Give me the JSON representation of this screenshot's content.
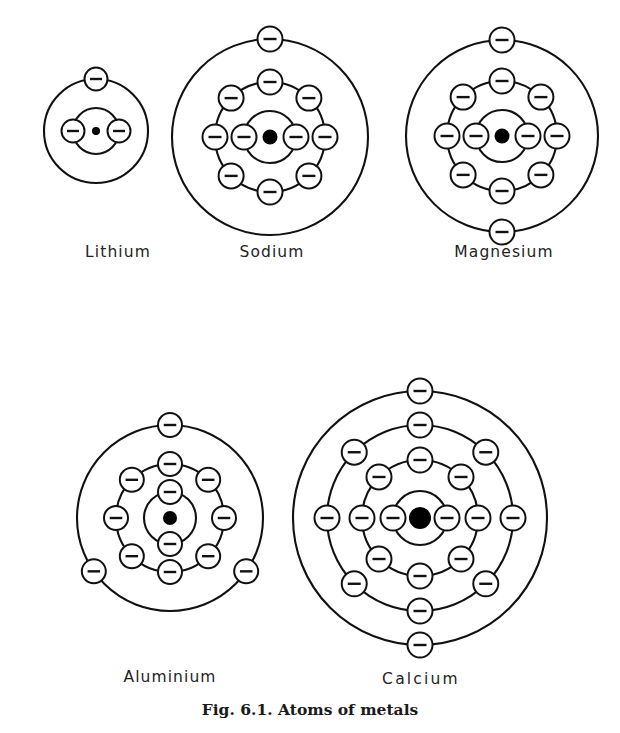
{
  "figure": {
    "caption": "Fig. 6.1. Atoms of metals",
    "background_color": "#ffffff",
    "line_color": "#111111",
    "electron_fill": "#ffffff",
    "nucleus_color": "#000000",
    "electron_glyph": "minus-sign"
  },
  "atoms": [
    {
      "id": "lithium",
      "label": "Lithium",
      "label_x": 118,
      "label_y": 243,
      "label_wide": false,
      "cx": 96,
      "cy": 131,
      "nucleus_radius": 4.0,
      "electron_radius": 11.5,
      "shells": [
        {
          "name": "shell-1",
          "radius": 23,
          "electron_count": 2,
          "angles": [
            180,
            0
          ]
        },
        {
          "name": "shell-2",
          "radius": 52,
          "electron_count": 1,
          "angles": [
            270
          ]
        }
      ],
      "configuration": "2, 1"
    },
    {
      "id": "sodium",
      "label": "Sodium",
      "label_x": 272,
      "label_y": 243,
      "label_wide": false,
      "cx": 270,
      "cy": 137,
      "nucleus_radius": 7.5,
      "electron_radius": 12.5,
      "shells": [
        {
          "name": "shell-1",
          "radius": 26,
          "electron_count": 2,
          "angles": [
            180,
            0
          ]
        },
        {
          "name": "shell-2",
          "radius": 55,
          "electron_count": 8,
          "angles": [
            270,
            315,
            0,
            45,
            90,
            135,
            180,
            225
          ]
        },
        {
          "name": "shell-3",
          "radius": 98,
          "electron_count": 1,
          "angles": [
            270
          ]
        }
      ],
      "configuration": "2, 8, 1"
    },
    {
      "id": "magnesium",
      "label": "Magnesium",
      "label_x": 504,
      "label_y": 243,
      "label_wide": false,
      "cx": 502,
      "cy": 136,
      "nucleus_radius": 7.5,
      "electron_radius": 12.5,
      "shells": [
        {
          "name": "shell-1",
          "radius": 26,
          "electron_count": 2,
          "angles": [
            180,
            0
          ]
        },
        {
          "name": "shell-2",
          "radius": 55,
          "electron_count": 8,
          "angles": [
            270,
            315,
            0,
            45,
            90,
            135,
            180,
            225
          ]
        },
        {
          "name": "shell-3",
          "radius": 96,
          "electron_count": 2,
          "angles": [
            270,
            90
          ]
        }
      ],
      "configuration": "2, 8, 2"
    },
    {
      "id": "aluminium",
      "label": "Aluminium",
      "label_x": 170,
      "label_y": 668,
      "label_wide": false,
      "cx": 170,
      "cy": 518,
      "nucleus_radius": 7.0,
      "electron_radius": 12.0,
      "shells": [
        {
          "name": "shell-1",
          "radius": 26,
          "electron_count": 2,
          "angles": [
            270,
            90
          ]
        },
        {
          "name": "shell-2",
          "radius": 54,
          "electron_count": 8,
          "angles": [
            270,
            315,
            0,
            45,
            90,
            135,
            180,
            225
          ]
        },
        {
          "name": "shell-3",
          "radius": 93,
          "electron_count": 3,
          "angles": [
            270,
            35,
            145
          ]
        }
      ],
      "configuration": "2, 8, 3"
    },
    {
      "id": "calcium",
      "label": "Calcium",
      "label_x": 421,
      "label_y": 670,
      "label_wide": true,
      "cx": 420,
      "cy": 518,
      "nucleus_radius": 11.0,
      "electron_radius": 12.5,
      "shells": [
        {
          "name": "shell-1",
          "radius": 27,
          "electron_count": 2,
          "angles": [
            180,
            0
          ]
        },
        {
          "name": "shell-2",
          "radius": 58,
          "electron_count": 8,
          "angles": [
            270,
            315,
            0,
            45,
            90,
            135,
            180,
            225
          ]
        },
        {
          "name": "shell-3",
          "radius": 93,
          "electron_count": 8,
          "angles": [
            270,
            315,
            0,
            45,
            90,
            135,
            180,
            225
          ]
        },
        {
          "name": "shell-4",
          "radius": 127,
          "electron_count": 2,
          "angles": [
            270,
            90
          ]
        }
      ],
      "configuration": "2, 8, 8, 2"
    }
  ]
}
